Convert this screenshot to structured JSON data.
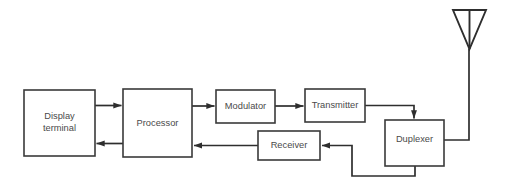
{
  "diagram": {
    "type": "block-diagram",
    "background_color": "#ffffff",
    "line_color": "#2e2e2e",
    "text_color": "#4a4a4a",
    "blocks": [
      {
        "id": "display-terminal",
        "label_line1": "Display",
        "label_line2": "terminal",
        "x": 24,
        "y": 90,
        "w": 71,
        "h": 66
      },
      {
        "id": "processor",
        "label_line1": "Processor",
        "label_line2": "",
        "x": 123,
        "y": 89,
        "w": 69,
        "h": 68
      },
      {
        "id": "modulator",
        "label_line1": "Modulator",
        "label_line2": "",
        "x": 216,
        "y": 90,
        "w": 59,
        "h": 33
      },
      {
        "id": "transmitter",
        "label_line1": "Transmitter",
        "label_line2": "",
        "x": 305,
        "y": 89,
        "w": 60,
        "h": 33
      },
      {
        "id": "receiver",
        "label_line1": "Receiver",
        "label_line2": "",
        "x": 258,
        "y": 131,
        "w": 62,
        "h": 29
      },
      {
        "id": "duplexer",
        "label_line1": "Duplexer",
        "label_line2": "",
        "x": 385,
        "y": 120,
        "w": 59,
        "h": 46
      }
    ],
    "antenna": {
      "id": "antenna",
      "label": "antenna",
      "left_x": 453,
      "right_x": 486,
      "top_y": 10,
      "apex_y": 49,
      "mast_x": 469,
      "mast_bottom_y": 140
    },
    "connections": [
      {
        "id": "display-to-processor",
        "from": "display-terminal",
        "to": "processor",
        "direction": "right"
      },
      {
        "id": "processor-to-display",
        "from": "processor",
        "to": "display-terminal",
        "direction": "left"
      },
      {
        "id": "processor-to-modulator",
        "from": "processor",
        "to": "modulator",
        "direction": "right"
      },
      {
        "id": "modulator-to-transmitter",
        "from": "modulator",
        "to": "transmitter",
        "direction": "right"
      },
      {
        "id": "transmitter-to-duplexer",
        "from": "transmitter",
        "to": "duplexer",
        "direction": "down"
      },
      {
        "id": "duplexer-to-antenna",
        "from": "duplexer",
        "to": "antenna",
        "direction": "up"
      },
      {
        "id": "duplexer-to-receiver",
        "from": "duplexer",
        "to": "receiver",
        "direction": "left"
      },
      {
        "id": "receiver-to-processor",
        "from": "receiver",
        "to": "processor",
        "direction": "left"
      }
    ]
  }
}
